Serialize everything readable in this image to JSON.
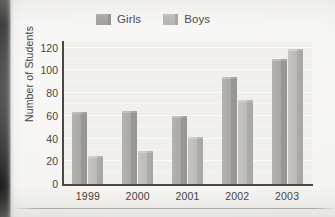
{
  "chart_data": {
    "type": "bar",
    "title": "",
    "subtitle": "",
    "xlabel": "",
    "ylabel": "Number of Students",
    "categories": [
      "1999",
      "2000",
      "2001",
      "2002",
      "2003"
    ],
    "series": [
      {
        "name": "Girls",
        "values": [
          63,
          64,
          60,
          94,
          110
        ],
        "color": "#a9a7a3"
      },
      {
        "name": "Boys",
        "values": [
          25,
          29,
          41,
          74,
          119
        ],
        "color": "#bcbab6"
      }
    ],
    "ylim": [
      0,
      125
    ],
    "yticks": [
      0,
      20,
      40,
      60,
      80,
      100,
      120
    ],
    "ytick_labels": [
      "0",
      "20",
      "40",
      "60",
      "80",
      "100",
      "120"
    ],
    "grid": true,
    "grid_axis": "y",
    "legend_position": "top-center",
    "annotations": []
  },
  "legend": {
    "entries": [
      {
        "label": "Girls",
        "swatch": "girls-swatch"
      },
      {
        "label": "Boys",
        "swatch": "boys-swatch"
      }
    ]
  },
  "axes": {
    "y_title": "Number of Students",
    "y_ticks": [
      "0",
      "20",
      "40",
      "60",
      "80",
      "100",
      "120"
    ],
    "x_ticks": [
      "1999",
      "2000",
      "2001",
      "2002",
      "2003"
    ]
  },
  "colors": {
    "girls": "#a9a7a3",
    "boys": "#bcbab6",
    "plot_background": "#f0efed",
    "page_background": "#f4f3f1",
    "axis": "#4a4845",
    "text": "#46443f",
    "gridline": "#fbfbfa"
  }
}
